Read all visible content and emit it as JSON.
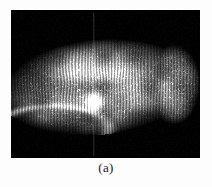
{
  "figure": {
    "caption": "(a)",
    "panel_label": "a",
    "page_background": "#fdfdfd",
    "image_background": "#000000",
    "modality": "grayscale micrograph",
    "frame": {
      "x": 11,
      "y": 10,
      "width": 189,
      "height": 148
    }
  },
  "chart_data": {
    "type": "heatmap",
    "title": "(a)",
    "subtitle": "",
    "xlabel": "",
    "ylabel": "",
    "colormap": "grayscale",
    "value_range": [
      0,
      255
    ],
    "grid": false,
    "legend": "none",
    "structures": [
      {
        "name": "specimen-body",
        "shape": "elongated-lobe",
        "cx": 0.46,
        "cy": 0.52,
        "rx": 0.52,
        "ry": 0.32,
        "rotation_deg": -9,
        "peak_intensity": 205
      },
      {
        "name": "rounded-tip",
        "shape": "ellipse",
        "cx": 0.86,
        "cy": 0.5,
        "rx": 0.14,
        "ry": 0.27,
        "peak_intensity": 150
      },
      {
        "name": "upper-ridge-highlight",
        "shape": "ellipse",
        "cx": 0.4,
        "cy": 0.33,
        "rx": 0.26,
        "ry": 0.14,
        "peak_intensity": 230
      },
      {
        "name": "central-bright-spot",
        "shape": "ellipse",
        "cx": 0.44,
        "cy": 0.62,
        "rx": 0.035,
        "ry": 0.055,
        "peak_intensity": 255
      },
      {
        "name": "lower-left-margin",
        "shape": "arc",
        "cx": 0.22,
        "cy": 0.8,
        "rx": 0.3,
        "ry": 0.16,
        "peak_intensity": 190
      },
      {
        "name": "vertical-seam",
        "shape": "line",
        "x": 0.435,
        "y0": 0.02,
        "y1": 0.98,
        "peak_intensity": 120
      }
    ],
    "texture": {
      "pattern": "vertical striations with granular speckle",
      "striation_spacing_px": 3,
      "speckle_density": 0.42
    }
  }
}
